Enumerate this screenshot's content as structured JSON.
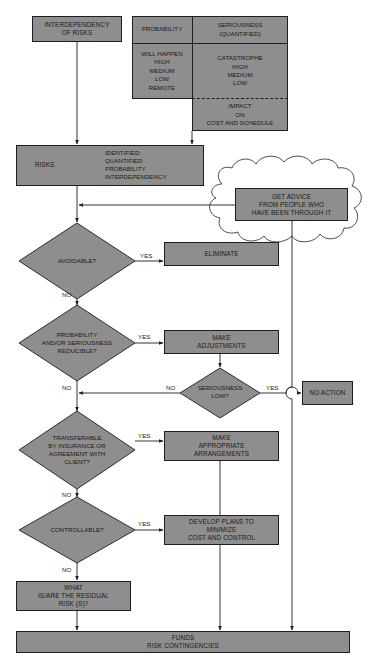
{
  "colors": {
    "fill": "#8e8e8e",
    "stroke": "#1e1e1e",
    "background": "#ffffff"
  },
  "nodes": {
    "interdependency": "INTERDEPENDENCY\nOF RISKS",
    "table": {
      "header_left": "PROBABILITY",
      "header_right": "SERIOUSNESS\n(QUANTIFIED)",
      "probability_levels": "WILL HAPPEN\nHIGH\nMEDIUM\nLOW\nREMOTE",
      "seriousness_levels": "CATASTROPHE\nHIGH\nMEDIUM\nLOW",
      "impact": "IMPACT\nON\nCOST AND SCHEDULE"
    },
    "risks": {
      "label": "RISKS",
      "attributes": "IDENTIFIED\nQUANTIFIED\nPROBABILITY\nINTERDEPENDENCY"
    },
    "advice": "GET ADVICE\nFROM PEOPLE WHO\nHAVE BEEN THROUGH IT",
    "avoidable": "AVOIDABLE?",
    "eliminate": "ELIMINATE",
    "reducible": "PROBABILITY\nAND/OR SERIOUSNESS\nREDUCIBLE?",
    "adjustments": "MAKE\nADJUSTMENTS",
    "seriousness_low": "SERIOUSNESS\nLOW?",
    "no_action": "NO ACTION",
    "transferable": "TRANSFERABLE\nBY INSURANCE OR\nAGREEMENT WITH\nCLIENT?",
    "arrangements": "MAKE\nAPPROPRIATE\nARRANGEMENTS",
    "controllable": "CONTROLLABLE?",
    "develop_plans": "DEVELOP PLANS TO\nMINIMIZE\nCOST AND CONTROL",
    "residual": "WHAT\nIS/ARE THE RESIDUAL\nRISK (S)?",
    "funds": "FUNDS\nRISK CONTINGENCIES"
  },
  "edge_labels": {
    "avoidable_yes": "YES",
    "avoidable_no": "NO",
    "reducible_yes": "YES",
    "reducible_no": "NO",
    "seriousness_yes": "YES",
    "seriousness_no": "NO",
    "transferable_yes": "YES",
    "transferable_no": "NO",
    "controllable_yes": "YES",
    "controllable_no": "NO"
  }
}
